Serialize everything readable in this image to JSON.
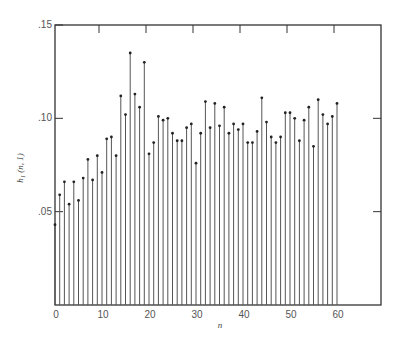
{
  "chart_data": {
    "type": "stem",
    "title": "",
    "xlabel": "n",
    "ylabel": "h₁ (n, 1)",
    "xlim": [
      0,
      70
    ],
    "ylim": [
      0,
      0.15
    ],
    "xticks": [
      0,
      10,
      20,
      30,
      40,
      50,
      60
    ],
    "xtick_labels": [
      "0",
      "10",
      "20",
      "30",
      "40",
      "50",
      "60"
    ],
    "yticks": [
      0.05,
      0.1,
      0.15
    ],
    "ytick_labels": [
      ".05",
      ".10",
      ".15"
    ],
    "grid": false,
    "legend": null,
    "x": [
      0,
      1,
      2,
      3,
      4,
      5,
      6,
      7,
      8,
      9,
      10,
      11,
      12,
      13,
      14,
      15,
      16,
      17,
      18,
      19,
      20,
      21,
      22,
      23,
      24,
      25,
      26,
      27,
      28,
      29,
      30,
      31,
      32,
      33,
      34,
      35,
      36,
      37,
      38,
      39,
      40,
      41,
      42,
      43,
      44,
      45,
      46,
      47,
      48,
      49,
      50,
      51,
      52,
      53,
      54,
      55,
      56,
      57,
      58,
      59,
      60
    ],
    "values": [
      0.043,
      0.059,
      0.066,
      0.054,
      0.066,
      0.056,
      0.068,
      0.078,
      0.067,
      0.08,
      0.071,
      0.089,
      0.09,
      0.08,
      0.112,
      0.102,
      0.135,
      0.113,
      0.106,
      0.13,
      0.081,
      0.087,
      0.101,
      0.099,
      0.1,
      0.092,
      0.088,
      0.088,
      0.095,
      0.097,
      0.076,
      0.092,
      0.109,
      0.095,
      0.108,
      0.096,
      0.106,
      0.092,
      0.097,
      0.094,
      0.097,
      0.087,
      0.087,
      0.093,
      0.111,
      0.098,
      0.09,
      0.087,
      0.09,
      0.103,
      0.103,
      0.1,
      0.088,
      0.099,
      0.106,
      0.085,
      0.11,
      0.102,
      0.097,
      0.101,
      0.108
    ]
  },
  "colors": {
    "stem": "#555555",
    "frame": "#333333",
    "marker": "#222222"
  }
}
